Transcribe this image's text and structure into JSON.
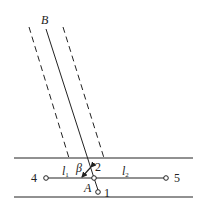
{
  "diagram": {
    "labels": {
      "B": "B",
      "A": "A",
      "beta": "β",
      "node1": "1",
      "node2": "2",
      "node4": "4",
      "node5": "5",
      "l1": "l",
      "l1_sub": "1",
      "l2": "l",
      "l2_sub": "2"
    },
    "colors": {
      "stroke": "#222222",
      "background": "#ffffff"
    }
  }
}
